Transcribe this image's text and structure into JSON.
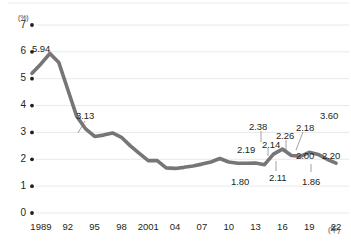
{
  "chart_data": {
    "type": "line",
    "title": "",
    "subtitle": "",
    "xlabel": "年",
    "ylabel": "(%)",
    "unit_label": "(%)",
    "x_axis_unit": "(年)",
    "grid": true,
    "legend": "none",
    "ylim": [
      0,
      7
    ],
    "y_ticks": [
      "0",
      "1",
      "2",
      "3",
      "4",
      "5",
      "6",
      "7"
    ],
    "x_tick_labels": [
      "1989",
      "92",
      "95",
      "98",
      "2001",
      "04",
      "07",
      "10",
      "13",
      "16",
      "19",
      "22"
    ],
    "x_tick_years": [
      1989,
      1992,
      1995,
      1998,
      2001,
      2004,
      2007,
      2010,
      2013,
      2016,
      2019,
      2022
    ],
    "xlim": [
      1988,
      2023
    ],
    "line_color": "#767676",
    "grid_color": "#e9e9ec",
    "text_color": "#231f20",
    "x": [
      1988,
      1989,
      1990,
      1991,
      1992,
      1993,
      1994,
      1995,
      1996,
      1997,
      1998,
      1999,
      2000,
      2001,
      2002,
      2003,
      2004,
      2005,
      2006,
      2007,
      2008,
      2009,
      2010,
      2011,
      2012,
      2013,
      2014,
      2015,
      2016,
      2017,
      2018,
      2019,
      2020,
      2021,
      2022
    ],
    "values": [
      5.2,
      5.55,
      5.94,
      5.6,
      4.6,
      3.6,
      3.13,
      2.85,
      2.9,
      2.98,
      2.82,
      2.5,
      2.22,
      1.95,
      1.95,
      1.68,
      1.66,
      1.7,
      1.75,
      1.82,
      1.9,
      2.03,
      1.9,
      1.85,
      1.85,
      1.86,
      1.8,
      2.19,
      2.38,
      2.14,
      2.11,
      2.26,
      2.18,
      2.0,
      1.86
    ],
    "labeled_points": [
      {
        "label": "5.94",
        "year": 1990,
        "value": 5.94,
        "label_x": 32,
        "label_y": 43,
        "leader": false
      },
      {
        "label": "3.13",
        "year": 1995,
        "value": 3.13,
        "label_x": 76,
        "label_y": 110,
        "leader": true,
        "lx1": 85,
        "ly1": 121,
        "lx2": 78,
        "ly2": 133
      },
      {
        "label": "1.80",
        "year": 2013,
        "value": 1.8,
        "label_x": 231,
        "label_y": 176,
        "leader": false
      },
      {
        "label": "2.19",
        "year": 2014,
        "value": 2.19,
        "label_x": 237,
        "label_y": 144,
        "leader": false
      },
      {
        "label": "2.38",
        "year": 2015,
        "value": 2.38,
        "label_x": 249,
        "label_y": 121,
        "leader": true,
        "lx1": 261,
        "ly1": 131,
        "lx2": 261,
        "ly2": 142
      },
      {
        "label": "2.14",
        "year": 2016,
        "value": 2.14,
        "label_x": 262,
        "label_y": 139,
        "leader": true,
        "lx1": 268,
        "ly1": 148,
        "lx2": 268,
        "ly2": 156
      },
      {
        "label": "2.11",
        "year": 2017,
        "value": 2.11,
        "label_x": 269,
        "label_y": 172,
        "leader": true,
        "lx1": 276,
        "ly1": 171,
        "lx2": 276,
        "ly2": 161
      },
      {
        "label": "2.26",
        "year": 2018,
        "value": 2.26,
        "label_x": 276,
        "label_y": 130,
        "leader": true,
        "lx1": 286,
        "ly1": 140,
        "lx2": 286,
        "ly2": 152
      },
      {
        "label": "2.18",
        "year": 2019,
        "value": 2.18,
        "label_x": 296,
        "label_y": 122,
        "leader": true,
        "lx1": 303,
        "ly1": 132,
        "lx2": 296,
        "ly2": 150
      },
      {
        "label": "2.00",
        "year": 2020,
        "value": 2.0,
        "label_x": 296,
        "label_y": 150,
        "leader": false
      },
      {
        "label": "1.86",
        "year": 2021,
        "value": 1.86,
        "label_x": 302,
        "label_y": 176,
        "leader": true,
        "lx1": 311,
        "ly1": 172,
        "lx2": 311,
        "ly2": 164
      },
      {
        "label": "3.60",
        "year": 2022,
        "value": 3.6,
        "label_x": 320,
        "label_y": 110,
        "leader": false
      },
      {
        "label": "2.20",
        "year": 2022,
        "value": 2.2,
        "label_x": 322,
        "label_y": 150,
        "leader": false
      }
    ]
  }
}
